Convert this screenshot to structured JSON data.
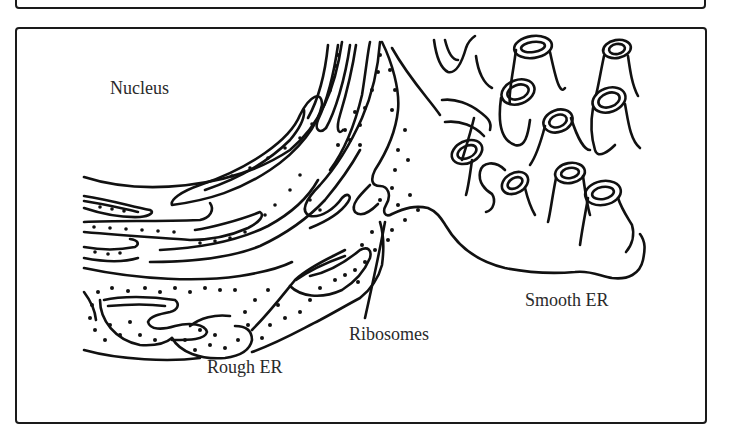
{
  "figure": {
    "labels": {
      "nucleus": "Nucleus",
      "smooth_er": "Smooth ER",
      "ribosomes": "Ribosomes",
      "rough_er": "Rough ER"
    },
    "colors": {
      "line": "#111111",
      "text": "#2a2a2a",
      "background": "#ffffff"
    }
  }
}
